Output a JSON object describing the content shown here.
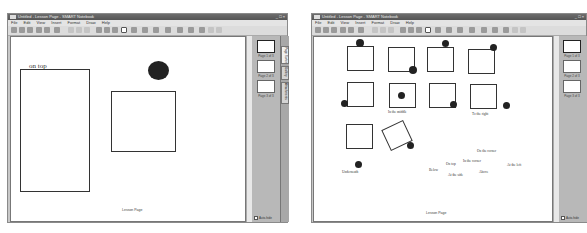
{
  "windows": [
    {
      "title": "Untitled - Lesson Page - SMART Notebook",
      "menu": [
        "File",
        "Edit",
        "View",
        "Insert",
        "Format",
        "Draw",
        "Help"
      ],
      "canvas": {
        "labels": [
          {
            "text": "on top"
          }
        ],
        "footer": "Lesson Page"
      },
      "side_panel": {
        "thumbnails": [
          {
            "label": "Page 1 of 3"
          },
          {
            "label": "Page 2 of 3"
          },
          {
            "label": "Page 3 of 3"
          }
        ],
        "tabs": [
          "Page Sorter",
          "Gallery",
          "Attachments"
        ],
        "auto_hide": "Auto-hide"
      }
    },
    {
      "title": "Untitled - Lesson Page - SMART Notebook",
      "menu": [
        "File",
        "Edit",
        "View",
        "Insert",
        "Format",
        "Draw",
        "Help"
      ],
      "canvas": {
        "labels": [
          {
            "text": "In the middle"
          },
          {
            "text": "To the right"
          },
          {
            "text": "On the corner"
          },
          {
            "text": "In the corner"
          },
          {
            "text": "On top"
          },
          {
            "text": "Below"
          },
          {
            "text": "At the side"
          },
          {
            "text": "Above"
          },
          {
            "text": "At the left"
          },
          {
            "text": "Underneath"
          }
        ],
        "footer": "Lesson Page"
      },
      "side_panel": {
        "thumbnails": [
          {
            "label": "Page 1 of 3"
          },
          {
            "label": "Page 2 of 3"
          },
          {
            "label": "Page 3 of 3"
          }
        ],
        "auto_hide": "Auto-hide"
      }
    }
  ],
  "window_controls": "_ □ ×"
}
